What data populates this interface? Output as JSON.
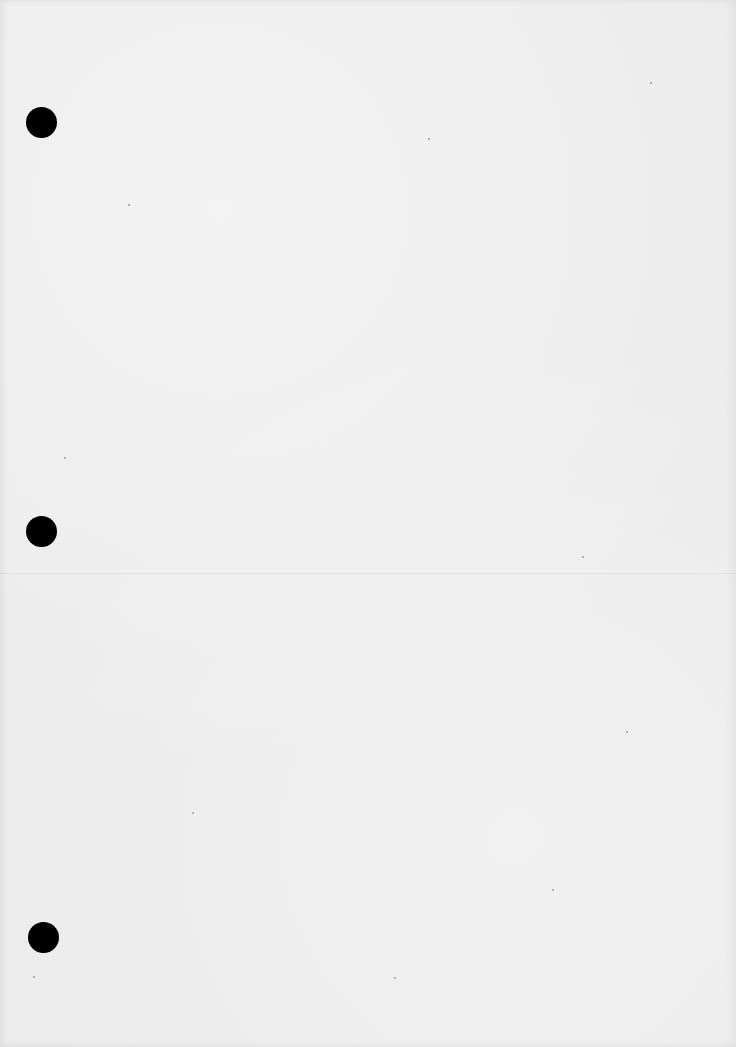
{
  "document": {
    "type": "blank scanned page",
    "background_color": "#ececec",
    "text_content": ""
  },
  "punch_holes": [
    {
      "x": 26,
      "y": 107,
      "size": 31,
      "color": "#000000"
    },
    {
      "x": 26,
      "y": 516,
      "size": 31,
      "color": "#000000"
    },
    {
      "x": 28,
      "y": 922,
      "size": 31,
      "color": "#000000"
    }
  ],
  "crease": {
    "y": 573
  }
}
